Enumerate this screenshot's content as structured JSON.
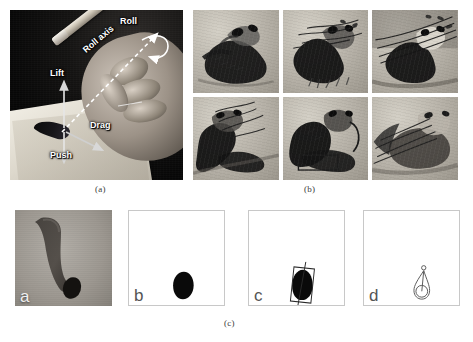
{
  "figure": {
    "panels": [
      {
        "id": "a",
        "caption": "(a)",
        "type": "photograph",
        "description": "Hand holding a Chinese writing brush on paper with annotated degrees of freedom",
        "annotations": [
          {
            "name": "roll",
            "label": "Roll"
          },
          {
            "name": "roll-axis",
            "label": "Roll axis"
          },
          {
            "name": "lift",
            "label": "Lift"
          },
          {
            "name": "drag",
            "label": "Drag"
          },
          {
            "name": "push",
            "label": "Push"
          }
        ]
      },
      {
        "id": "b",
        "caption": "(b)",
        "type": "image-grid",
        "rows": 2,
        "columns": 3,
        "cells": [
          {
            "index": 1,
            "description": "ink painting of panda with bamboo"
          },
          {
            "index": 2,
            "description": "ink painting of panda holding bamboo stalks"
          },
          {
            "index": 3,
            "description": "ink painting of panda among dense bamboo leaves"
          },
          {
            "index": 4,
            "description": "ink painting of reclining panda with bamboo"
          },
          {
            "index": 5,
            "description": "ink painting of panda leaning back"
          },
          {
            "index": 6,
            "description": "ink painting of panda chewing bamboo"
          }
        ]
      },
      {
        "id": "c",
        "caption": "(c)",
        "type": "sub-panel-row",
        "subpanels": [
          {
            "id": "a",
            "label": "a",
            "kind": "photo",
            "description": "photograph of the real brush tip with bent bristles"
          },
          {
            "id": "b",
            "label": "b",
            "kind": "diagram",
            "description": "filled silhouette of the brush footprint"
          },
          {
            "id": "c",
            "label": "c",
            "kind": "diagram",
            "description": "brush footprint with bounding rectangle and major axis"
          },
          {
            "id": "d",
            "label": "d",
            "kind": "diagram",
            "description": "outlined teardrop model with tip point and base circle"
          }
        ]
      }
    ]
  }
}
